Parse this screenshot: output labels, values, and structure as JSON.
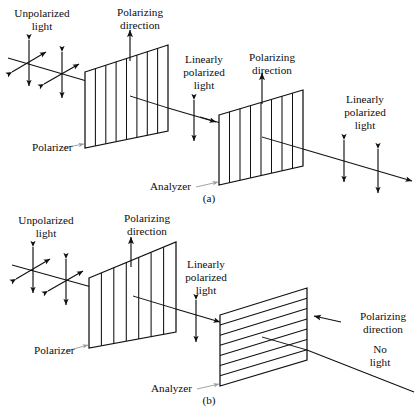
{
  "figure": {
    "background_color": "#ffffff",
    "ink_color": "#111111",
    "leader_color": "#9a9a9a",
    "width": 418,
    "height": 418
  },
  "panels": [
    {
      "id": "a",
      "caption": "(a)",
      "description": "Polarizer and analyzer with parallel polarizing directions: light is transmitted",
      "labels": {
        "unpolarized_light": "Unpolarized\nlight",
        "unpolarized_light_line1": "Unpolarized",
        "unpolarized_light_line2": "light",
        "polarizing_direction_1_line1": "Polarizing",
        "polarizing_direction_1_line2": "direction",
        "linear_mid_line1": "Linearly",
        "linear_mid_line2": "polarized",
        "linear_mid_line3": "light",
        "polarizing_direction_2_line1": "Polarizing",
        "polarizing_direction_2_line2": "direction",
        "linear_out_line1": "Linearly",
        "linear_out_line2": "polarized",
        "linear_out_line3": "light",
        "polarizer": "Polarizer",
        "analyzer": "Analyzer"
      },
      "elements": {
        "polarizer_orientation": "vertical",
        "analyzer_orientation": "vertical",
        "polarizer_stripes": 8,
        "analyzer_stripes": 8,
        "outcome": "linearly polarized light transmitted"
      }
    },
    {
      "id": "b",
      "caption": "(b)",
      "description": "Polarizer and analyzer with crossed polarizing directions: no light is transmitted",
      "labels": {
        "unpolarized_light_line1": "Unpolarized",
        "unpolarized_light_line2": "light",
        "polarizing_direction_1_line1": "Polarizing",
        "polarizing_direction_1_line2": "direction",
        "linear_mid_line1": "Linearly",
        "linear_mid_line2": "polarized",
        "linear_mid_line3": "light",
        "polarizing_direction_2_line1": "Polarizing",
        "polarizing_direction_2_line2": "direction",
        "no_light_line1": "No",
        "no_light_line2": "light",
        "polarizer": "Polarizer",
        "analyzer": "Analyzer"
      },
      "elements": {
        "polarizer_orientation": "vertical",
        "analyzer_orientation": "horizontal",
        "polarizer_stripes": 8,
        "analyzer_stripes": 8,
        "outcome": "no light transmitted"
      }
    }
  ]
}
